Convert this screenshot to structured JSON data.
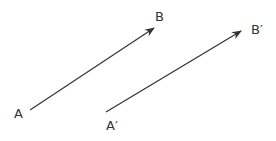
{
  "diagram": {
    "type": "translation-vectors",
    "color": "#333333",
    "vectors": [
      {
        "name": "AB",
        "start_label": "A",
        "end_label": "B"
      },
      {
        "name": "A'B'",
        "start_label": "A′",
        "end_label": "B′"
      }
    ]
  }
}
